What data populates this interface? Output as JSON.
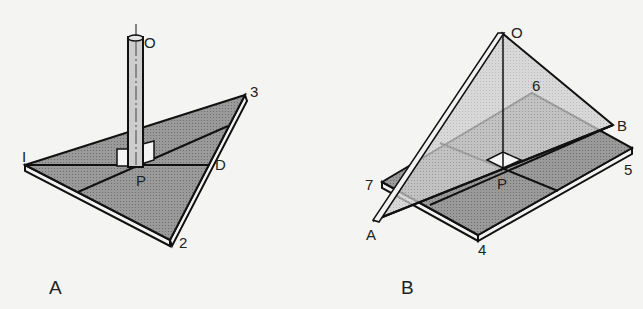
{
  "figure_a": {
    "caption": "A",
    "labels": {
      "o": "O",
      "v1": "I",
      "v2": "2",
      "v3": "3",
      "d": "D",
      "p": "P"
    }
  },
  "figure_b": {
    "caption": "B",
    "labels": {
      "o": "O",
      "a": "A",
      "b": "B",
      "p": "P",
      "v4": "4",
      "v5": "5",
      "v6": "6",
      "v7": "7"
    }
  },
  "colors": {
    "plate": "#8c8c8c",
    "light_plane": "#c6c6c6",
    "line": "#111111",
    "pole": "#c9c9c9"
  }
}
